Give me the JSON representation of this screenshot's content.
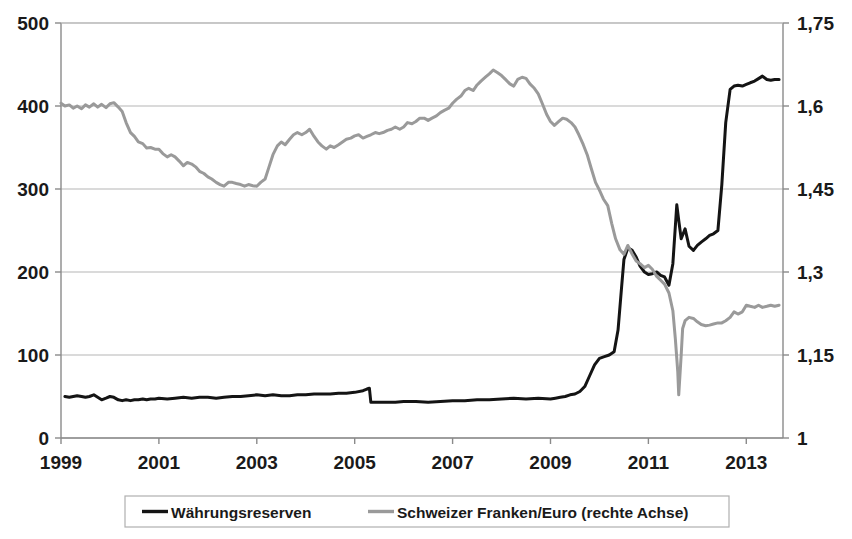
{
  "chart_data": {
    "type": "line",
    "title": "",
    "subtitle": "",
    "xlabel": "",
    "ylabel": "",
    "grid": true,
    "legend_position": "bottom",
    "x_ticks": [
      "1999",
      "2001",
      "2003",
      "2005",
      "2007",
      "2009",
      "2011",
      "2013"
    ],
    "x_tick_values": [
      1999,
      2001,
      2003,
      2005,
      2007,
      2009,
      2011,
      2013
    ],
    "xlim": [
      1999,
      2013.75
    ],
    "left_axis": {
      "ticks": [
        "0",
        "100",
        "200",
        "300",
        "400",
        "500"
      ],
      "tick_values": [
        0,
        100,
        200,
        300,
        400,
        500
      ],
      "ylim": [
        0,
        500
      ]
    },
    "right_axis": {
      "ticks": [
        "1",
        "1,15",
        "1,3",
        "1,45",
        "1,6",
        "1,75"
      ],
      "tick_values": [
        1,
        1.15,
        1.3,
        1.45,
        1.6,
        1.75
      ],
      "ylim": [
        1,
        1.75
      ]
    },
    "series": [
      {
        "name": "Währungsreserven",
        "color": "#141414",
        "axis": "left",
        "width": 3.0,
        "x": [
          1999.08,
          1999.17,
          1999.25,
          1999.33,
          1999.42,
          1999.5,
          1999.58,
          1999.67,
          1999.75,
          1999.83,
          1999.92,
          2000.0,
          2000.08,
          2000.17,
          2000.25,
          2000.33,
          2000.42,
          2000.5,
          2000.58,
          2000.67,
          2000.75,
          2000.83,
          2000.92,
          2001.0,
          2001.17,
          2001.33,
          2001.5,
          2001.67,
          2001.83,
          2002.0,
          2002.17,
          2002.33,
          2002.5,
          2002.67,
          2002.83,
          2003.0,
          2003.17,
          2003.33,
          2003.5,
          2003.67,
          2003.83,
          2004.0,
          2004.17,
          2004.33,
          2004.5,
          2004.67,
          2004.83,
          2005.0,
          2005.17,
          2005.25,
          2005.3,
          2005.33,
          2005.5,
          2005.67,
          2005.83,
          2006.0,
          2006.25,
          2006.5,
          2006.75,
          2007.0,
          2007.25,
          2007.5,
          2007.75,
          2008.0,
          2008.25,
          2008.5,
          2008.75,
          2009.0,
          2009.1,
          2009.2,
          2009.3,
          2009.4,
          2009.5,
          2009.6,
          2009.7,
          2009.8,
          2009.9,
          2010.0,
          2010.1,
          2010.2,
          2010.3,
          2010.38,
          2010.45,
          2010.5,
          2010.58,
          2010.67,
          2010.75,
          2010.83,
          2010.92,
          2011.0,
          2011.08,
          2011.17,
          2011.25,
          2011.33,
          2011.42,
          2011.5,
          2011.58,
          2011.62,
          2011.67,
          2011.75,
          2011.83,
          2011.92,
          2012.0,
          2012.08,
          2012.17,
          2012.25,
          2012.33,
          2012.42,
          2012.5,
          2012.58,
          2012.67,
          2012.75,
          2012.83,
          2012.92,
          2013.0,
          2013.08,
          2013.17,
          2013.25,
          2013.33,
          2013.42,
          2013.5,
          2013.58,
          2013.67
        ],
        "y": [
          50,
          49,
          50,
          51,
          50,
          49,
          50,
          52,
          49,
          46,
          48,
          50,
          49,
          46,
          45,
          46,
          45,
          46,
          46,
          47,
          46,
          47,
          47,
          48,
          47,
          48,
          49,
          48,
          49,
          49,
          48,
          49,
          50,
          50,
          51,
          52,
          51,
          52,
          51,
          51,
          52,
          52,
          53,
          53,
          53,
          54,
          54,
          55,
          57,
          59,
          60,
          43,
          43,
          43,
          43,
          44,
          44,
          43,
          44,
          45,
          45,
          46,
          46,
          47,
          48,
          47,
          48,
          47,
          48,
          49,
          50,
          52,
          53,
          56,
          62,
          75,
          88,
          96,
          98,
          100,
          104,
          130,
          180,
          215,
          229,
          226,
          218,
          207,
          200,
          197,
          198,
          200,
          196,
          194,
          184,
          210,
          281,
          262,
          240,
          252,
          231,
          226,
          232,
          236,
          240,
          244,
          246,
          250,
          305,
          380,
          420,
          424,
          425,
          424,
          426,
          428,
          430,
          433,
          436,
          432,
          431,
          432,
          432
        ]
      },
      {
        "name": "Schweizer Franken/Euro (rechte Achse)",
        "color": "#9a9a9a",
        "axis": "right",
        "width": 3.0,
        "x": [
          1999.0,
          1999.08,
          1999.17,
          1999.25,
          1999.33,
          1999.42,
          1999.5,
          1999.58,
          1999.67,
          1999.75,
          1999.83,
          1999.92,
          2000.0,
          2000.08,
          2000.17,
          2000.25,
          2000.33,
          2000.42,
          2000.5,
          2000.58,
          2000.67,
          2000.75,
          2000.83,
          2000.92,
          2001.0,
          2001.08,
          2001.17,
          2001.25,
          2001.33,
          2001.42,
          2001.5,
          2001.58,
          2001.67,
          2001.75,
          2001.83,
          2001.92,
          2002.0,
          2002.08,
          2002.17,
          2002.25,
          2002.33,
          2002.42,
          2002.5,
          2002.58,
          2002.67,
          2002.75,
          2002.83,
          2002.92,
          2003.0,
          2003.08,
          2003.17,
          2003.25,
          2003.33,
          2003.42,
          2003.5,
          2003.58,
          2003.67,
          2003.75,
          2003.83,
          2003.92,
          2004.0,
          2004.08,
          2004.17,
          2004.25,
          2004.33,
          2004.42,
          2004.5,
          2004.58,
          2004.67,
          2004.75,
          2004.83,
          2004.92,
          2005.0,
          2005.08,
          2005.17,
          2005.25,
          2005.33,
          2005.42,
          2005.5,
          2005.58,
          2005.67,
          2005.75,
          2005.83,
          2005.92,
          2006.0,
          2006.08,
          2006.17,
          2006.25,
          2006.33,
          2006.42,
          2006.5,
          2006.58,
          2006.67,
          2006.75,
          2006.83,
          2006.92,
          2007.0,
          2007.08,
          2007.17,
          2007.25,
          2007.33,
          2007.42,
          2007.5,
          2007.58,
          2007.67,
          2007.75,
          2007.83,
          2007.92,
          2008.0,
          2008.08,
          2008.17,
          2008.25,
          2008.33,
          2008.42,
          2008.5,
          2008.58,
          2008.67,
          2008.75,
          2008.83,
          2008.92,
          2009.0,
          2009.08,
          2009.17,
          2009.25,
          2009.33,
          2009.42,
          2009.5,
          2009.58,
          2009.67,
          2009.75,
          2009.83,
          2009.92,
          2010.0,
          2010.08,
          2010.17,
          2010.25,
          2010.33,
          2010.42,
          2010.5,
          2010.58,
          2010.67,
          2010.75,
          2010.83,
          2010.92,
          2011.0,
          2011.08,
          2011.17,
          2011.25,
          2011.33,
          2011.42,
          2011.5,
          2011.55,
          2011.6,
          2011.62,
          2011.67,
          2011.7,
          2011.75,
          2011.83,
          2011.92,
          2012.0,
          2012.08,
          2012.17,
          2012.25,
          2012.33,
          2012.42,
          2012.5,
          2012.58,
          2012.67,
          2012.75,
          2012.83,
          2012.92,
          2013.0,
          2013.08,
          2013.17,
          2013.25,
          2013.33,
          2013.42,
          2013.5,
          2013.58,
          2013.67
        ],
        "y": [
          1.605,
          1.6,
          1.602,
          1.596,
          1.6,
          1.595,
          1.602,
          1.598,
          1.604,
          1.598,
          1.603,
          1.597,
          1.604,
          1.606,
          1.598,
          1.59,
          1.57,
          1.552,
          1.545,
          1.535,
          1.532,
          1.524,
          1.525,
          1.522,
          1.522,
          1.514,
          1.508,
          1.512,
          1.508,
          1.5,
          1.492,
          1.498,
          1.495,
          1.49,
          1.482,
          1.478,
          1.472,
          1.468,
          1.462,
          1.458,
          1.455,
          1.462,
          1.462,
          1.46,
          1.458,
          1.455,
          1.458,
          1.456,
          1.455,
          1.462,
          1.468,
          1.49,
          1.512,
          1.528,
          1.535,
          1.53,
          1.54,
          1.548,
          1.552,
          1.548,
          1.552,
          1.558,
          1.545,
          1.535,
          1.528,
          1.522,
          1.528,
          1.525,
          1.53,
          1.535,
          1.54,
          1.542,
          1.546,
          1.548,
          1.542,
          1.545,
          1.548,
          1.552,
          1.55,
          1.552,
          1.556,
          1.558,
          1.562,
          1.558,
          1.562,
          1.57,
          1.568,
          1.572,
          1.578,
          1.578,
          1.574,
          1.578,
          1.582,
          1.588,
          1.592,
          1.596,
          1.605,
          1.612,
          1.618,
          1.628,
          1.632,
          1.628,
          1.638,
          1.645,
          1.652,
          1.658,
          1.665,
          1.66,
          1.655,
          1.648,
          1.64,
          1.636,
          1.648,
          1.652,
          1.65,
          1.64,
          1.632,
          1.622,
          1.605,
          1.585,
          1.572,
          1.565,
          1.572,
          1.578,
          1.576,
          1.57,
          1.562,
          1.548,
          1.53,
          1.512,
          1.488,
          1.462,
          1.448,
          1.432,
          1.42,
          1.388,
          1.36,
          1.34,
          1.332,
          1.348,
          1.332,
          1.32,
          1.315,
          1.308,
          1.312,
          1.305,
          1.292,
          1.285,
          1.278,
          1.262,
          1.23,
          1.18,
          1.12,
          1.078,
          1.15,
          1.198,
          1.212,
          1.218,
          1.216,
          1.21,
          1.205,
          1.203,
          1.204,
          1.206,
          1.208,
          1.208,
          1.212,
          1.218,
          1.228,
          1.224,
          1.228,
          1.24,
          1.238,
          1.236,
          1.24,
          1.236,
          1.238,
          1.24,
          1.238,
          1.24
        ]
      }
    ],
    "legend": [
      {
        "label": "Währungsreserven",
        "color": "#141414"
      },
      {
        "label": "Schweizer Franken/Euro (rechte Achse)",
        "color": "#9a9a9a"
      }
    ]
  },
  "colors": {
    "series_black": "#141414",
    "series_gray": "#9a9a9a",
    "gridline": "#b5b5b5",
    "axis": "#8a8a8a",
    "text": "#1a1a1a",
    "background": "#ffffff",
    "legend_border": "#b0b0b0"
  }
}
